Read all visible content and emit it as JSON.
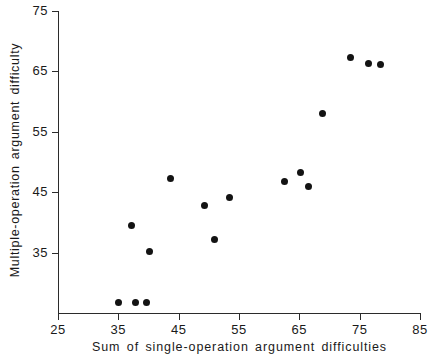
{
  "chart_data": {
    "type": "scatter",
    "title": "",
    "xlabel": "Sum of single-operation argument difficulties",
    "ylabel": "Multiple-operation argument difficulty",
    "xlim": [
      25,
      85
    ],
    "ylim": [
      25,
      75
    ],
    "xticks": [
      25,
      35,
      45,
      55,
      65,
      75,
      85
    ],
    "yticks": [
      35,
      45,
      55,
      65,
      75
    ],
    "xtick_labels": [
      "25",
      "35",
      "45",
      "55",
      "65",
      "75",
      "85"
    ],
    "ytick_labels": [
      "35",
      "45",
      "55",
      "65",
      "75"
    ],
    "grid": false,
    "legend": null,
    "marker": "filled-circle",
    "marker_color": "#131313",
    "axis_color": "#2b2b2b",
    "background_color": "#ffffff",
    "points": [
      {
        "x": 35.0,
        "y": 26.7
      },
      {
        "x": 37.9,
        "y": 26.7
      },
      {
        "x": 39.7,
        "y": 26.7
      },
      {
        "x": 37.1,
        "y": 39.5
      },
      {
        "x": 40.1,
        "y": 35.2
      },
      {
        "x": 43.6,
        "y": 47.3
      },
      {
        "x": 49.2,
        "y": 42.8
      },
      {
        "x": 50.9,
        "y": 37.2
      },
      {
        "x": 53.5,
        "y": 44.2
      },
      {
        "x": 62.6,
        "y": 46.7
      },
      {
        "x": 65.2,
        "y": 48.3
      },
      {
        "x": 66.6,
        "y": 46.0
      },
      {
        "x": 68.8,
        "y": 58.1
      },
      {
        "x": 73.4,
        "y": 67.3
      },
      {
        "x": 76.4,
        "y": 66.3
      },
      {
        "x": 78.5,
        "y": 66.2
      }
    ]
  }
}
